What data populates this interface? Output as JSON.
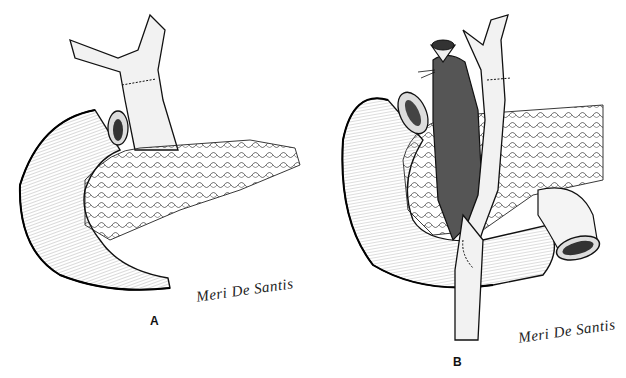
{
  "figure": {
    "panels": [
      {
        "id": "A",
        "label": "A",
        "signature": "Meri De Santis",
        "structures": [
          "bile-duct-anastomosis",
          "duodenum-stump",
          "duodenum",
          "pancreas"
        ]
      },
      {
        "id": "B",
        "label": "B",
        "signature": "Meri De Santis",
        "structures": [
          "gallbladder-ligated",
          "bile-duct",
          "duodenum",
          "pancreas",
          "jejunal-loop",
          "jejunum-anastomosis"
        ]
      }
    ],
    "colors": {
      "ink": "#111111",
      "shade": "#555555",
      "background": "#ffffff"
    }
  }
}
